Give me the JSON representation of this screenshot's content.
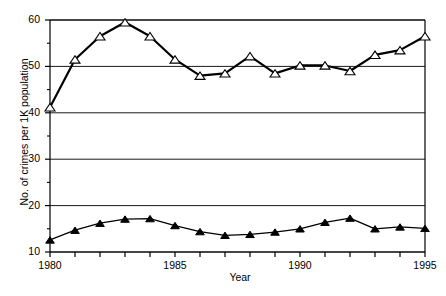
{
  "chart_data": {
    "type": "line",
    "title": "",
    "xlabel": "Year",
    "ylabel": "No. of crimes per 1K population",
    "xlim": [
      1980,
      1995
    ],
    "ylim": [
      10,
      60
    ],
    "xticks": [
      1980,
      1981,
      1982,
      1983,
      1984,
      1985,
      1986,
      1987,
      1988,
      1989,
      1990,
      1991,
      1992,
      1993,
      1994,
      1995
    ],
    "xtick_labels": [
      "1980",
      "",
      "",
      "",
      "",
      "1985",
      "",
      "",
      "",
      "",
      "1990",
      "",
      "",
      "",
      "",
      "1995"
    ],
    "yticks": [
      10,
      20,
      30,
      40,
      50,
      60
    ],
    "ytick_labels": [
      "10",
      "20",
      "30",
      "40",
      "50",
      "60"
    ],
    "yminorticks": [
      15,
      25,
      35,
      45,
      55
    ],
    "grid": "horizontal-major",
    "legend": "none",
    "x": [
      1980,
      1981,
      1982,
      1983,
      1984,
      1985,
      1986,
      1987,
      1988,
      1989,
      1990,
      1991,
      1992,
      1993,
      1994,
      1995
    ],
    "series": [
      {
        "name": "Total crimes (open triangle)",
        "marker": "open-triangle",
        "color": "#000000",
        "values": [
          41.2,
          51.5,
          56.5,
          59.5,
          56.5,
          51.5,
          48.0,
          48.5,
          52.2,
          48.5,
          50.2,
          50.2,
          49.0,
          52.5,
          53.5,
          56.5
        ]
      },
      {
        "name": "Violent crimes (filled triangle)",
        "marker": "filled-triangle",
        "color": "#000000",
        "values": [
          12.6,
          14.7,
          16.2,
          17.1,
          17.2,
          15.7,
          14.4,
          13.6,
          13.8,
          14.3,
          15.0,
          16.4,
          17.3,
          15.0,
          15.4,
          15.1
        ]
      }
    ]
  },
  "axes": {
    "plot_left": 50,
    "plot_right": 425,
    "plot_top": 20,
    "plot_bottom": 252
  }
}
